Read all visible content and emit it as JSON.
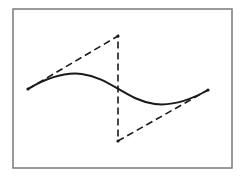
{
  "figure": {
    "frame": {
      "x": 13,
      "y": 9,
      "width": 219,
      "height": 159,
      "stroke": "#7a7a7a"
    },
    "control_points": [
      {
        "name": "P0",
        "x": 28,
        "y": 89
      },
      {
        "name": "P1",
        "x": 118,
        "y": 36
      },
      {
        "name": "P2",
        "x": 118,
        "y": 141
      },
      {
        "name": "P3",
        "x": 208,
        "y": 90
      }
    ],
    "curve_color": "#1a1a1a",
    "polygon_color": "#1a1a1a",
    "polygon_dash": "7,4"
  }
}
